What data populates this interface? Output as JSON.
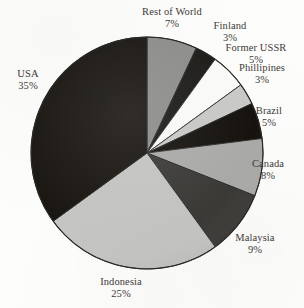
{
  "chart_data": {
    "type": "pie",
    "title": "",
    "subtitle": "",
    "xlabel": "",
    "ylabel": "",
    "legend_position": "none",
    "grid": false,
    "labels_outside": true,
    "start_angle_deg": 0,
    "direction": "clockwise",
    "categories": [
      "Rest of World",
      "Finland",
      "Former USSR",
      "Phillipines",
      "Brazil",
      "Canada",
      "Malaysia",
      "Indonesia",
      "USA"
    ],
    "values": [
      7,
      3,
      5,
      3,
      5,
      8,
      9,
      25,
      35
    ],
    "value_suffix": "%",
    "total": 100,
    "slices": [
      {
        "label": "Rest of World",
        "value": 7,
        "value_text": "7%",
        "color": "#8d8d8b"
      },
      {
        "label": "Finland",
        "value": 3,
        "value_text": "3%",
        "color": "#1d1b18"
      },
      {
        "label": "Former USSR",
        "value": 5,
        "value_text": "5%",
        "color": "#fbfbfa"
      },
      {
        "label": "Phillipines",
        "value": 3,
        "value_text": "3%",
        "color": "#c9c9c7"
      },
      {
        "label": "Brazil",
        "value": 5,
        "value_text": "5%",
        "color": "#16130f"
      },
      {
        "label": "Canada",
        "value": 8,
        "value_text": "8%",
        "color": "#aaaaa8"
      },
      {
        "label": "Malaysia",
        "value": 9,
        "value_text": "9%",
        "color": "#3b3a37"
      },
      {
        "label": "Indonesia",
        "value": 25,
        "value_text": "25%",
        "color": "#c5c5c3"
      },
      {
        "label": "USA",
        "value": 35,
        "value_text": "35%",
        "color": "#1a1612"
      }
    ],
    "geometry": {
      "center_x": 147,
      "center_y": 153,
      "radius": 116
    },
    "colors": {
      "background": "#fdfdfc",
      "text": "#3e3b38",
      "outline": "#2a2a28"
    }
  }
}
